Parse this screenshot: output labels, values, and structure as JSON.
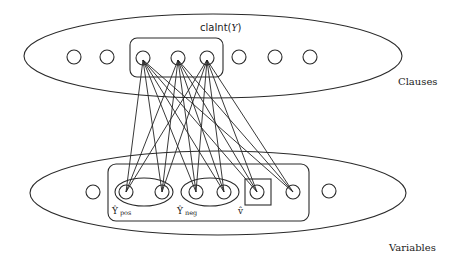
{
  "diagram": {
    "title_label": "claInt(Y)",
    "title_label_prefix": "claInt(",
    "title_label_var": "Y",
    "title_label_suffix": ")",
    "clauses_label": "Clauses",
    "variables_label": "Variables",
    "groups": {
      "y_pos": {
        "symbol": "Ŷ",
        "subscript": "pos"
      },
      "y_neg": {
        "symbol": "Ŷ",
        "subscript": "neg"
      },
      "v_hat": {
        "symbol": "v̂"
      }
    },
    "clause_nodes": [
      {
        "id": "c1",
        "x": 74,
        "y": 57,
        "in_group": false
      },
      {
        "id": "c2",
        "x": 107,
        "y": 57,
        "in_group": false
      },
      {
        "id": "c3",
        "x": 143,
        "y": 58,
        "in_group": true
      },
      {
        "id": "c4",
        "x": 178,
        "y": 58,
        "in_group": true
      },
      {
        "id": "c5",
        "x": 207,
        "y": 58,
        "in_group": true
      },
      {
        "id": "c6",
        "x": 239,
        "y": 57,
        "in_group": false
      },
      {
        "id": "c7",
        "x": 275,
        "y": 57,
        "in_group": false
      },
      {
        "id": "c8",
        "x": 310,
        "y": 57,
        "in_group": false
      }
    ],
    "variable_nodes": [
      {
        "id": "v0",
        "x": 93,
        "y": 192,
        "group": "none"
      },
      {
        "id": "v1",
        "x": 126,
        "y": 192,
        "group": "y_pos"
      },
      {
        "id": "v2",
        "x": 162,
        "y": 192,
        "group": "y_pos"
      },
      {
        "id": "v3",
        "x": 196,
        "y": 192,
        "group": "y_neg"
      },
      {
        "id": "v4",
        "x": 224,
        "y": 192,
        "group": "y_neg"
      },
      {
        "id": "v5",
        "x": 257,
        "y": 192,
        "group": "v_hat"
      },
      {
        "id": "v6",
        "x": 293,
        "y": 192,
        "group": "inner"
      },
      {
        "id": "v7",
        "x": 329,
        "y": 191,
        "group": "none"
      }
    ],
    "edges": [
      [
        "c3",
        "v1"
      ],
      [
        "c3",
        "v2"
      ],
      [
        "c3",
        "v3"
      ],
      [
        "c3",
        "v4"
      ],
      [
        "c3",
        "v5"
      ],
      [
        "c3",
        "v6"
      ],
      [
        "c4",
        "v1"
      ],
      [
        "c4",
        "v2"
      ],
      [
        "c4",
        "v3"
      ],
      [
        "c4",
        "v4"
      ],
      [
        "c4",
        "v5"
      ],
      [
        "c4",
        "v6"
      ],
      [
        "c5",
        "v1"
      ],
      [
        "c5",
        "v2"
      ],
      [
        "c5",
        "v3"
      ],
      [
        "c5",
        "v4"
      ],
      [
        "c5",
        "v5"
      ],
      [
        "c5",
        "v6"
      ]
    ],
    "colors": {
      "stroke": "#2a2a2a",
      "background": "#ffffff"
    }
  }
}
